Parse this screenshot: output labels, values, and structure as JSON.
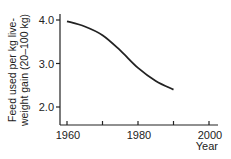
{
  "chart_data": {
    "type": "line",
    "title": "",
    "xlabel": "Year",
    "ylabel_line1": "Feed used per kg live-",
    "ylabel_line2": "weight gain (20–100 kg)",
    "ylabel": "Feed used per kg live-weight gain (20–100 kg)",
    "xlim": [
      1957,
      2003
    ],
    "ylim": [
      1.6,
      4.2
    ],
    "x_ticks": [
      1960,
      1970,
      1980,
      1990,
      2000
    ],
    "x_tick_labels": [
      "1960",
      "",
      "1980",
      "",
      "2000"
    ],
    "y_ticks": [
      2.0,
      3.0,
      4.0
    ],
    "y_tick_labels": [
      "2.0",
      "3.0",
      "4.0"
    ],
    "grid": false,
    "legend": null,
    "series": [
      {
        "name": "Feed conversion",
        "x": [
          1960,
          1965,
          1970,
          1975,
          1980,
          1985,
          1990
        ],
        "values": [
          3.97,
          3.85,
          3.65,
          3.3,
          2.9,
          2.6,
          2.4
        ]
      }
    ],
    "line_color": "#222222"
  }
}
